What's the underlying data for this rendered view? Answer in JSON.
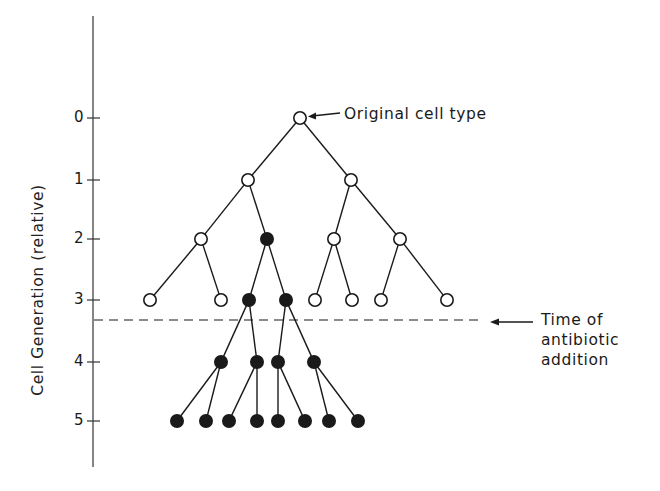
{
  "axis": {
    "title": "Cell Generation (relative)",
    "ticks": [
      {
        "label": "0",
        "y": 118
      },
      {
        "label": "1",
        "y": 180
      },
      {
        "label": "2",
        "y": 239
      },
      {
        "label": "3",
        "y": 300
      },
      {
        "label": "4",
        "y": 362
      },
      {
        "label": "5",
        "y": 421
      }
    ]
  },
  "annotations": {
    "original": "Original cell type",
    "antibiotic_line1": "Time of",
    "antibiotic_line2": "antibiotic",
    "antibiotic_line3": "addition"
  },
  "legend_semantics": {
    "open_circle": "susceptible cell (original type)",
    "filled_circle": "resistant mutant cell"
  },
  "tree": {
    "nodes": [
      {
        "id": "g0",
        "gen": 0,
        "x": 300,
        "y": 118,
        "filled": false
      },
      {
        "id": "g1a",
        "gen": 1,
        "x": 248,
        "y": 180,
        "filled": false,
        "parent": "g0"
      },
      {
        "id": "g1b",
        "gen": 1,
        "x": 351,
        "y": 180,
        "filled": false,
        "parent": "g0"
      },
      {
        "id": "g2a",
        "gen": 2,
        "x": 201,
        "y": 239,
        "filled": false,
        "parent": "g1a"
      },
      {
        "id": "g2b",
        "gen": 2,
        "x": 267,
        "y": 239,
        "filled": true,
        "parent": "g1a"
      },
      {
        "id": "g2c",
        "gen": 2,
        "x": 334,
        "y": 239,
        "filled": false,
        "parent": "g1b"
      },
      {
        "id": "g2d",
        "gen": 2,
        "x": 400,
        "y": 239,
        "filled": false,
        "parent": "g1b"
      },
      {
        "id": "g3a",
        "gen": 3,
        "x": 150,
        "y": 300,
        "filled": false,
        "parent": "g2a"
      },
      {
        "id": "g3b",
        "gen": 3,
        "x": 221,
        "y": 300,
        "filled": false,
        "parent": "g2a"
      },
      {
        "id": "g3c",
        "gen": 3,
        "x": 249,
        "y": 300,
        "filled": true,
        "parent": "g2b"
      },
      {
        "id": "g3d",
        "gen": 3,
        "x": 286,
        "y": 300,
        "filled": true,
        "parent": "g2b"
      },
      {
        "id": "g3e",
        "gen": 3,
        "x": 315,
        "y": 300,
        "filled": false,
        "parent": "g2c"
      },
      {
        "id": "g3f",
        "gen": 3,
        "x": 352,
        "y": 300,
        "filled": false,
        "parent": "g2c"
      },
      {
        "id": "g3g",
        "gen": 3,
        "x": 381,
        "y": 300,
        "filled": false,
        "parent": "g2d"
      },
      {
        "id": "g3h",
        "gen": 3,
        "x": 447,
        "y": 300,
        "filled": false,
        "parent": "g2d"
      },
      {
        "id": "g4a",
        "gen": 4,
        "x": 221,
        "y": 362,
        "filled": true,
        "parent": "g3c"
      },
      {
        "id": "g4b",
        "gen": 4,
        "x": 257,
        "y": 362,
        "filled": true,
        "parent": "g3c"
      },
      {
        "id": "g4c",
        "gen": 4,
        "x": 278,
        "y": 362,
        "filled": true,
        "parent": "g3d"
      },
      {
        "id": "g4d",
        "gen": 4,
        "x": 314,
        "y": 362,
        "filled": true,
        "parent": "g3d"
      },
      {
        "id": "g5a",
        "gen": 5,
        "x": 177,
        "y": 421,
        "filled": true,
        "parent": "g4a"
      },
      {
        "id": "g5b",
        "gen": 5,
        "x": 206,
        "y": 421,
        "filled": true,
        "parent": "g4a"
      },
      {
        "id": "g5c",
        "gen": 5,
        "x": 229,
        "y": 421,
        "filled": true,
        "parent": "g4b"
      },
      {
        "id": "g5d",
        "gen": 5,
        "x": 257,
        "y": 421,
        "filled": true,
        "parent": "g4b"
      },
      {
        "id": "g5e",
        "gen": 5,
        "x": 278,
        "y": 421,
        "filled": true,
        "parent": "g4c"
      },
      {
        "id": "g5f",
        "gen": 5,
        "x": 305,
        "y": 421,
        "filled": true,
        "parent": "g4c"
      },
      {
        "id": "g5g",
        "gen": 5,
        "x": 329,
        "y": 421,
        "filled": true,
        "parent": "g4d"
      },
      {
        "id": "g5h",
        "gen": 5,
        "x": 358,
        "y": 421,
        "filled": true,
        "parent": "g4d"
      }
    ]
  },
  "antibiotic_line": {
    "y": 320,
    "x1": 94,
    "x2": 482
  },
  "colors": {
    "ink": "#1a1a1a",
    "dash": "#555555",
    "background": "#ffffff"
  }
}
